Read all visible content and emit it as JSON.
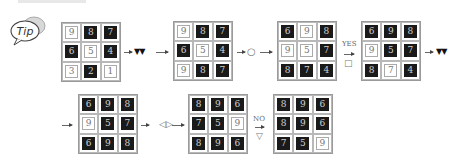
{
  "tip_label": "Tip",
  "steps": [
    {
      "ops": "tri",
      "symbol": "▼▼"
    },
    {
      "ops": "circle",
      "symbol": "○"
    },
    {
      "ops": "yes",
      "label": "YES",
      "symbol": "□"
    },
    {
      "ops": "tri2",
      "symbol": "▼▼"
    },
    {
      "ops": "mirror",
      "symbol": "◁▷"
    },
    {
      "ops": "no",
      "label": "NO",
      "symbol": "▽"
    }
  ],
  "grids": [
    {
      "name": "grid-1",
      "cells": [
        {
          "v": "9",
          "dark": false
        },
        {
          "v": "8",
          "dark": true
        },
        {
          "v": "7",
          "dark": true
        },
        {
          "v": "6",
          "dark": true
        },
        {
          "v": "5",
          "dark": false
        },
        {
          "v": "4",
          "dark": true
        },
        {
          "v": "3",
          "dark": false
        },
        {
          "v": "2",
          "dark": true
        },
        {
          "v": "1",
          "dark": false
        }
      ]
    },
    {
      "name": "grid-2",
      "cells": [
        {
          "v": "9",
          "dark": false
        },
        {
          "v": "8",
          "dark": true
        },
        {
          "v": "7",
          "dark": true
        },
        {
          "v": "6",
          "dark": true
        },
        {
          "v": "5",
          "dark": false
        },
        {
          "v": "4",
          "dark": true
        },
        {
          "v": "9",
          "dark": false
        },
        {
          "v": "8",
          "dark": true
        },
        {
          "v": "7",
          "dark": true
        }
      ]
    },
    {
      "name": "grid-3",
      "cells": [
        {
          "v": "6",
          "dark": true
        },
        {
          "v": "9",
          "dark": false
        },
        {
          "v": "8",
          "dark": true
        },
        {
          "v": "9",
          "dark": false
        },
        {
          "v": "5",
          "dark": false
        },
        {
          "v": "7",
          "dark": true
        },
        {
          "v": "8",
          "dark": true
        },
        {
          "v": "7",
          "dark": true
        },
        {
          "v": "4",
          "dark": true
        }
      ]
    },
    {
      "name": "grid-4",
      "cells": [
        {
          "v": "6",
          "dark": true
        },
        {
          "v": "9",
          "dark": true
        },
        {
          "v": "8",
          "dark": true
        },
        {
          "v": "9",
          "dark": false
        },
        {
          "v": "5",
          "dark": true
        },
        {
          "v": "7",
          "dark": true
        },
        {
          "v": "8",
          "dark": true
        },
        {
          "v": "7",
          "dark": false
        },
        {
          "v": "4",
          "dark": true
        }
      ]
    },
    {
      "name": "grid-5",
      "cells": [
        {
          "v": "6",
          "dark": true
        },
        {
          "v": "9",
          "dark": true
        },
        {
          "v": "8",
          "dark": true
        },
        {
          "v": "9",
          "dark": false
        },
        {
          "v": "5",
          "dark": true
        },
        {
          "v": "7",
          "dark": true
        },
        {
          "v": "6",
          "dark": true
        },
        {
          "v": "9",
          "dark": true
        },
        {
          "v": "8",
          "dark": true
        }
      ]
    },
    {
      "name": "grid-6",
      "cells": [
        {
          "v": "8",
          "dark": true
        },
        {
          "v": "9",
          "dark": true
        },
        {
          "v": "6",
          "dark": true
        },
        {
          "v": "7",
          "dark": true
        },
        {
          "v": "5",
          "dark": true
        },
        {
          "v": "9",
          "dark": false
        },
        {
          "v": "8",
          "dark": true
        },
        {
          "v": "9",
          "dark": true
        },
        {
          "v": "6",
          "dark": true
        }
      ]
    },
    {
      "name": "grid-7",
      "cells": [
        {
          "v": "8",
          "dark": true
        },
        {
          "v": "9",
          "dark": true
        },
        {
          "v": "6",
          "dark": true
        },
        {
          "v": "8",
          "dark": true
        },
        {
          "v": "9",
          "dark": true
        },
        {
          "v": "6",
          "dark": true
        },
        {
          "v": "7",
          "dark": true
        },
        {
          "v": "5",
          "dark": true
        },
        {
          "v": "9",
          "dark": false
        }
      ]
    }
  ]
}
